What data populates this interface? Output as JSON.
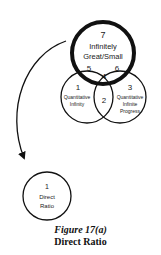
{
  "diagram": {
    "big_circle": {
      "number": "7",
      "line1": "Infinitely",
      "line2": "Great/Small"
    },
    "left_circle": {
      "number": "1",
      "line1": "Quantitative",
      "line2": "Infinity"
    },
    "right_circle": {
      "number": "3",
      "line1": "Quantitative",
      "line2": "Infinite",
      "line3": "Progress"
    },
    "intersections": {
      "center_bottom": "2",
      "center_top": "4",
      "left_top": "5",
      "right_top": "6"
    },
    "result_circle": {
      "number": "1",
      "line1": "Direct",
      "line2": "Ratio"
    }
  },
  "caption": {
    "figure": "Figure 17(a)",
    "title": "Direct Ratio"
  }
}
